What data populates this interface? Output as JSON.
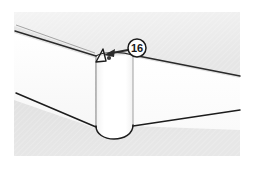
{
  "figure": {
    "kind": "technical-line-illustration",
    "canvas": {
      "width": 254,
      "height": 169
    },
    "background_color": "#ffffff",
    "panel": {
      "name": "illustration-panel",
      "x": 14,
      "y": 12,
      "width": 226,
      "height": 144,
      "fill_color": "#e3e3e3"
    },
    "surfaces": [
      {
        "name": "top-face",
        "label": "top-face",
        "fill_color": "#efefef"
      },
      {
        "name": "left-side-face",
        "label": "left-side-face",
        "fill_color": "#fbfbfb"
      },
      {
        "name": "right-side-face",
        "label": "right-side-face",
        "fill_color": "#fdfdfd"
      },
      {
        "name": "corner-round-face",
        "label": "corner-round-face",
        "fill_color": "#ffffff"
      }
    ],
    "line_color": "#1c1c1c",
    "detail_marker": {
      "name": "corner-notch-detail",
      "label": "notch"
    }
  },
  "callout": {
    "number": "16",
    "bubble": {
      "cx": 137,
      "cy": 48,
      "r": 9,
      "fill_color": "#ffffff",
      "stroke_color": "#1c1c1c"
    },
    "leader": {
      "name": "leader-arrow",
      "from_x": 128,
      "from_y": 50,
      "to_x": 107,
      "to_y": 55,
      "color": "#2a2a2a"
    }
  }
}
